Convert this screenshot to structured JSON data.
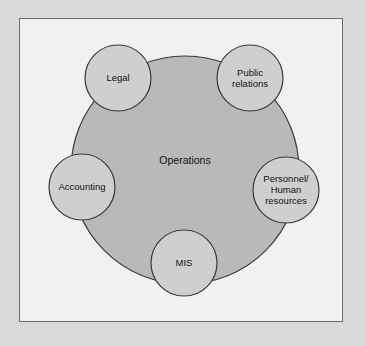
{
  "diagram": {
    "type": "circle-cluster-diagram",
    "frame": {
      "border_color": "#6e6e6e",
      "inner_background": "#f1f1f1",
      "outer_background": "#d9d9d9"
    },
    "colors": {
      "center_fill": "#b9b9b9",
      "satellite_fill": "#cfcfcf",
      "stroke": "#3a3a3a",
      "text": "#111111"
    },
    "center": {
      "label": "Operations",
      "cx": 185,
      "cy": 170,
      "r": 114,
      "label_x": 185,
      "label_y": 160
    },
    "satellites": [
      {
        "label": "Legal",
        "name": "legal",
        "cx": 118,
        "cy": 78,
        "r": 33
      },
      {
        "label": "Public\nrelations",
        "name": "public-relations",
        "cx": 250,
        "cy": 78,
        "r": 33
      },
      {
        "label": "Accounting",
        "name": "accounting",
        "cx": 82,
        "cy": 187,
        "r": 33
      },
      {
        "label": "Personnel/\nHuman\nresources",
        "name": "personnel-human-resources",
        "cx": 286,
        "cy": 190,
        "r": 33
      },
      {
        "label": "MIS",
        "name": "mis",
        "cx": 184,
        "cy": 263,
        "r": 33
      }
    ]
  }
}
